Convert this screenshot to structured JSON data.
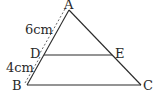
{
  "diagram": {
    "type": "geometry-triangle",
    "points": {
      "A": {
        "label": "A",
        "x": 69,
        "y": 10
      },
      "B": {
        "label": "B",
        "x": 27,
        "y": 85
      },
      "C": {
        "label": "C",
        "x": 141,
        "y": 85
      },
      "D": {
        "label": "D",
        "x": 44,
        "y": 55
      },
      "E": {
        "label": "E",
        "x": 112,
        "y": 55
      }
    },
    "segments": [
      [
        "A",
        "B"
      ],
      [
        "A",
        "C"
      ],
      [
        "B",
        "C"
      ],
      [
        "D",
        "E"
      ]
    ],
    "measurements": {
      "AD": "6cm",
      "DB": "4cm"
    },
    "colors": {
      "line": "#2a2a2a",
      "dimension": "#555555"
    }
  }
}
